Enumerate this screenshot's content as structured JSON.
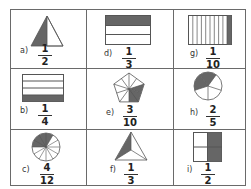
{
  "worksheet": {
    "colors": {
      "shade": "#666666",
      "line": "#555555",
      "border": "#6a6a6a"
    },
    "cells": [
      {
        "id": "a",
        "label": "a)",
        "numerator": "1",
        "denominator": "2",
        "shape": "triangle-half"
      },
      {
        "id": "d",
        "label": "d)",
        "numerator": "1",
        "denominator": "3",
        "shape": "rectangle-3-rows"
      },
      {
        "id": "g",
        "label": "g)",
        "numerator": "1",
        "denominator": "10",
        "shape": "rectangle-10-columns"
      },
      {
        "id": "b",
        "label": "b)",
        "numerator": "1",
        "denominator": "4",
        "shape": "rectangle-4-rows"
      },
      {
        "id": "e",
        "label": "e)",
        "numerator": "3",
        "denominator": "10",
        "shape": "pentagon-10-parts"
      },
      {
        "id": "h",
        "label": "h)",
        "numerator": "2",
        "denominator": "5",
        "shape": "circle-5-parts"
      },
      {
        "id": "c",
        "label": "c)",
        "numerator": "4",
        "denominator": "12",
        "shape": "circle-12-parts"
      },
      {
        "id": "f",
        "label": "f)",
        "numerator": "1",
        "denominator": "3",
        "shape": "triangle-3-parts"
      },
      {
        "id": "i",
        "label": "i)",
        "numerator": "1",
        "denominator": "2",
        "shape": "square-4-parts"
      }
    ]
  }
}
